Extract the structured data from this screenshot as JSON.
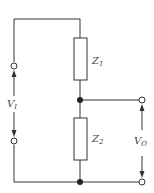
{
  "diagram": {
    "type": "circuit",
    "components": [
      {
        "id": "Z1",
        "label": "Z",
        "sub": "1",
        "kind": "impedance"
      },
      {
        "id": "Z2",
        "label": "Z",
        "sub": "2",
        "kind": "impedance"
      }
    ],
    "input_voltage": {
      "label": "V",
      "sub": "I"
    },
    "output_voltage": {
      "label": "V",
      "sub": "O"
    },
    "colors": {
      "line": "#333333",
      "node": "#222222",
      "background": "#ffffff"
    }
  }
}
